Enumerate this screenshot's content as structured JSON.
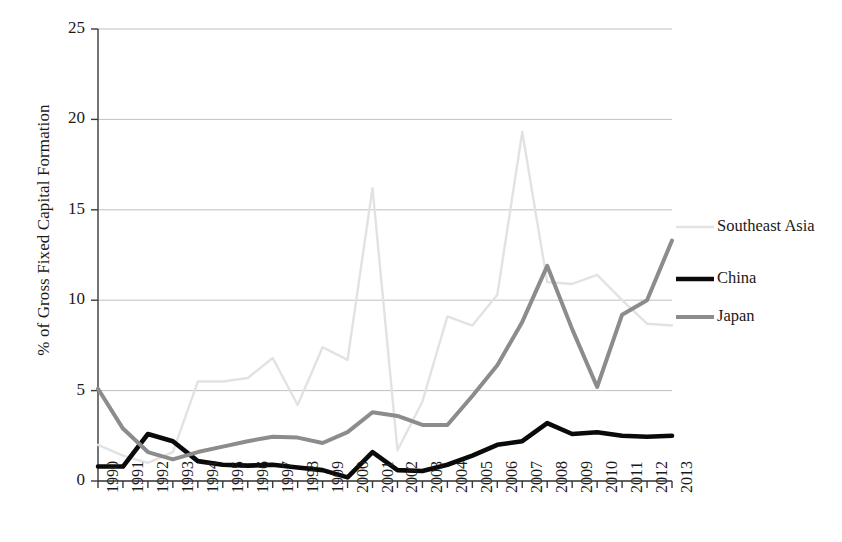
{
  "chart_data": {
    "type": "line",
    "title": "",
    "subtitle": "",
    "xlabel": "",
    "ylabel": "% of Gross Fixed Capital Formation",
    "categories": [
      "1990",
      "1991",
      "1992",
      "1993",
      "1994",
      "1995",
      "1996",
      "1997",
      "1998",
      "1999",
      "2000",
      "2001",
      "2002",
      "2003",
      "2004",
      "2005",
      "2006",
      "2007",
      "2008",
      "2009",
      "2010",
      "2011",
      "2012",
      "2013"
    ],
    "x": [
      1990,
      1991,
      1992,
      1993,
      1994,
      1995,
      1996,
      1997,
      1998,
      1999,
      2000,
      2001,
      2002,
      2003,
      2004,
      2005,
      2006,
      2007,
      2008,
      2009,
      2010,
      2011,
      2012,
      2013
    ],
    "xlim": [
      1990,
      2013
    ],
    "ylim": [
      0,
      25
    ],
    "yticks": [
      0,
      5,
      10,
      15,
      20,
      25
    ],
    "ytick_labels": [
      "0",
      "5",
      "10",
      "15",
      "20",
      "25"
    ],
    "grid": "horizontal",
    "legend_position": "right",
    "series": [
      {
        "name": "Southeast Asia",
        "color": "#e2e2e2",
        "width": 2.4,
        "values": [
          2.0,
          1.4,
          1.0,
          1.6,
          5.5,
          5.5,
          5.7,
          6.8,
          4.2,
          7.4,
          6.7,
          16.2,
          1.7,
          4.4,
          9.1,
          8.6,
          10.3,
          19.3,
          11.0,
          10.9,
          11.4,
          10.0,
          8.7,
          8.6
        ]
      },
      {
        "name": "China",
        "color": "#0a0a0a",
        "width": 4.6,
        "values": [
          0.8,
          0.8,
          2.6,
          2.2,
          1.1,
          0.9,
          0.85,
          0.9,
          0.75,
          0.6,
          0.2,
          1.6,
          0.6,
          0.55,
          0.9,
          1.4,
          2.0,
          2.2,
          3.2,
          2.6,
          2.7,
          2.5,
          2.45,
          2.5
        ]
      },
      {
        "name": "Japan",
        "color": "#8c8c8c",
        "width": 4.0,
        "values": [
          5.1,
          2.9,
          1.6,
          1.2,
          1.6,
          1.9,
          2.2,
          2.45,
          2.4,
          2.1,
          2.7,
          3.8,
          3.6,
          3.1,
          3.1,
          4.7,
          6.4,
          8.8,
          11.9,
          8.4,
          5.2,
          9.2,
          10.0,
          13.3
        ]
      }
    ]
  },
  "legend": {
    "items": [
      {
        "label": "Southeast Asia"
      },
      {
        "label": "China"
      },
      {
        "label": "Japan"
      }
    ]
  }
}
